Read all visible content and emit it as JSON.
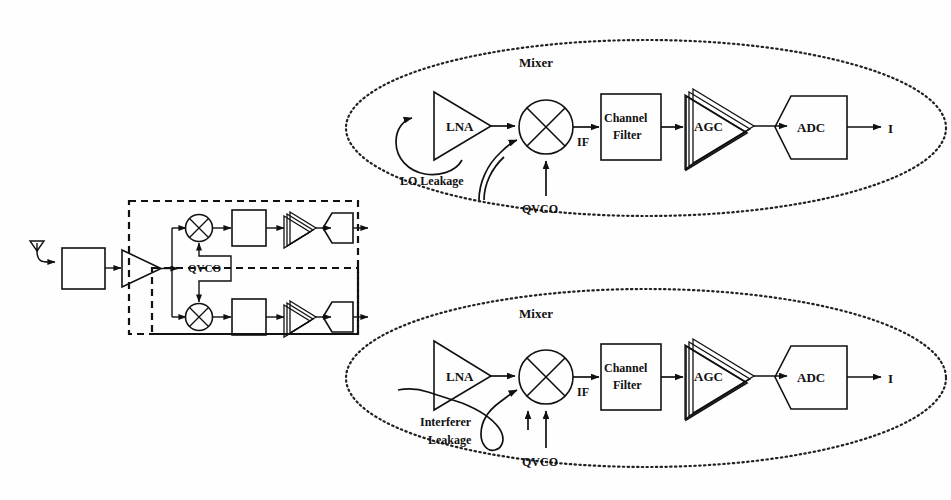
{
  "figure": {
    "background": "#ffffff",
    "ink": "#111111"
  },
  "overview": {
    "name": "quadrature-receiver-overview",
    "antenna_label": "",
    "blocks": [
      {
        "id": "rf-filter",
        "type": "box",
        "label": ""
      },
      {
        "id": "lna",
        "type": "triangle",
        "label": ""
      },
      {
        "id": "mixer-i",
        "type": "mixer-circle",
        "label": ""
      },
      {
        "id": "filter-i",
        "type": "box",
        "label": ""
      },
      {
        "id": "agc-i",
        "type": "agc-triangles",
        "label": ""
      },
      {
        "id": "adc-i",
        "type": "adc-hexagon",
        "label": ""
      },
      {
        "id": "mixer-q",
        "type": "mixer-circle",
        "label": ""
      },
      {
        "id": "filter-q",
        "type": "box",
        "label": ""
      },
      {
        "id": "agc-q",
        "type": "agc-triangles",
        "label": ""
      },
      {
        "id": "adc-q",
        "type": "adc-hexagon",
        "label": ""
      }
    ],
    "qvco_label": "QVCO"
  },
  "detail_top": {
    "name": "lo-leakage-detail",
    "leakage_label": "LO Leakage",
    "stages": [
      {
        "id": "lna",
        "label": "LNA"
      },
      {
        "id": "mixer",
        "label": "Mixer"
      },
      {
        "id": "channel-filter",
        "label": "Channel\nFilter",
        "line1": "Channel",
        "line2": "Filter"
      },
      {
        "id": "agc",
        "label": "AGC"
      },
      {
        "id": "adc",
        "label": "ADC"
      }
    ],
    "if_label": "IF",
    "qvco_label": "QVCO",
    "output_label": "I"
  },
  "detail_bottom": {
    "name": "interferer-leakage-detail",
    "leakage_label_line1": "Interferer",
    "leakage_label_line2": "Leakage",
    "stages": [
      {
        "id": "lna",
        "label": "LNA"
      },
      {
        "id": "mixer",
        "label": "Mixer"
      },
      {
        "id": "channel-filter",
        "label": "Channel Filter",
        "line1": "Channel",
        "line2": "Filter"
      },
      {
        "id": "agc",
        "label": "AGC"
      },
      {
        "id": "adc",
        "label": "ADC"
      }
    ],
    "if_label": "IF",
    "qvco_label": "QVCO",
    "output_label": "I"
  }
}
